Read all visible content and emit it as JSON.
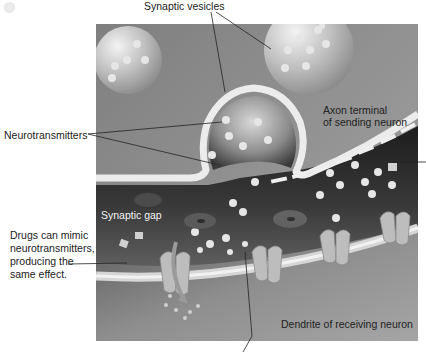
{
  "figure": {
    "colors": {
      "background": "#ffffff",
      "axon_interior": "#8f8f8f",
      "synaptic_gap": "#2e2e2e",
      "dendrite_interior": "#8a8a8a",
      "membrane": "#e9e9e9",
      "vesicle": "#c9c9c9",
      "leader_line": "#222222"
    }
  },
  "labels": {
    "synaptic_vesicles": "Synaptic vesicles",
    "neurotransmitters": "Neurotransmitters",
    "axon_terminal_line1": "Axon terminal",
    "axon_terminal_line2": "of sending neuron",
    "synaptic_gap": "Synaptic gap",
    "drugs_line1": "Drugs can mimic",
    "drugs_line2": "neurotransmitters,",
    "drugs_line3": "producing the",
    "drugs_line4": "same effect.",
    "dendrite": "Dendrite of receiving neuron"
  },
  "icons": {
    "vesicle": "vesicle-icon",
    "neurotransmitter": "neurotransmitter-icon",
    "receptor": "receptor-icon",
    "ion_flow_arrow": "arrow-icon"
  }
}
